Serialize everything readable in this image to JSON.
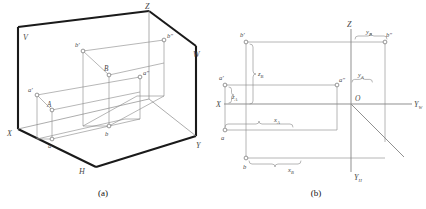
{
  "figure": {
    "panels": [
      {
        "caption": "(a)",
        "description": "Pictorial view of the three mutually perpendicular projection planes V, H, W with points A and B and their projections",
        "plane_labels": [
          {
            "name": "V",
            "text": "V"
          },
          {
            "name": "H",
            "text": "H"
          },
          {
            "name": "W",
            "text": "W"
          }
        ],
        "axis_labels": [
          {
            "name": "X",
            "text": "X"
          },
          {
            "name": "Y",
            "text": "Y"
          },
          {
            "name": "Z",
            "text": "Z"
          }
        ],
        "point_labels": [
          {
            "name": "A",
            "text": "A"
          },
          {
            "name": "B",
            "text": "B"
          },
          {
            "name": "a-front",
            "text": "a'"
          },
          {
            "name": "b-front",
            "text": "b'"
          },
          {
            "name": "a-side",
            "text": "a\""
          },
          {
            "name": "b-side",
            "text": "b\""
          },
          {
            "name": "a-top",
            "text": "a"
          },
          {
            "name": "b-top",
            "text": "b"
          }
        ]
      },
      {
        "caption": "(b)",
        "description": "Unfolded two dimensional projection drawing with coordinate dimensions",
        "axis_labels": [
          {
            "name": "X",
            "text": "X"
          },
          {
            "name": "Z",
            "text": "Z"
          },
          {
            "name": "Yw",
            "text": "Y",
            "subscript": "W"
          },
          {
            "name": "Yh",
            "text": "Y",
            "subscript": "H"
          },
          {
            "name": "origin",
            "text": "O"
          }
        ],
        "point_labels": [
          {
            "name": "a-front",
            "text": "a'"
          },
          {
            "name": "b-front",
            "text": "b'"
          },
          {
            "name": "a-side",
            "text": "a\""
          },
          {
            "name": "b-side",
            "text": "b\""
          },
          {
            "name": "a-top",
            "text": "a"
          },
          {
            "name": "b-top",
            "text": "b"
          }
        ],
        "dimensions": [
          {
            "name": "zA",
            "text": "z",
            "subscript": "A"
          },
          {
            "name": "zB",
            "text": "z",
            "subscript": "B"
          },
          {
            "name": "yA",
            "text": "y",
            "subscript": "A"
          },
          {
            "name": "yB",
            "text": "y",
            "subscript": "B"
          },
          {
            "name": "xA",
            "text": "x",
            "subscript": "A"
          },
          {
            "name": "xB",
            "text": "x",
            "subscript": "B"
          }
        ]
      }
    ]
  },
  "colors": {
    "heavy_line": "#1a1a1a",
    "thin_line": "#8a8a8a",
    "label_text": "#4a4a4a",
    "caption_text": "#111111",
    "background": "#ffffff",
    "point_marker_fill": "#ffffff"
  }
}
